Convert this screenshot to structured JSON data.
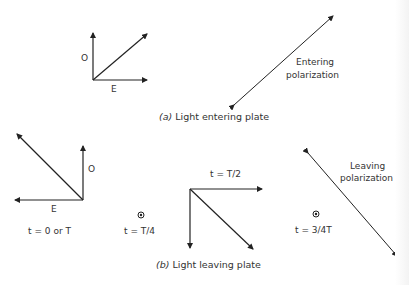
{
  "figure": {
    "part_a": {
      "caption_prefix": "(a)",
      "caption_text": "Light entering plate",
      "axis_labels": {
        "o": "O",
        "e": "E"
      },
      "polarization_label_line1": "Entering",
      "polarization_label_line2": "polarization"
    },
    "part_b": {
      "caption_prefix": "(b)",
      "caption_text": "Light leaving plate",
      "states": [
        {
          "time_label": "t = 0 or T",
          "o": "O",
          "e": "E"
        },
        {
          "time_label": "t = T/4",
          "symbol": "dot-in-circle"
        },
        {
          "time_label": "t = T/2"
        },
        {
          "time_label": "t = 3/4T",
          "symbol": "dot-in-circle"
        }
      ],
      "polarization_label_line1": "Leaving",
      "polarization_label_line2": "polarization"
    },
    "colors": {
      "line": "#222222",
      "background": "#ffffff"
    }
  }
}
